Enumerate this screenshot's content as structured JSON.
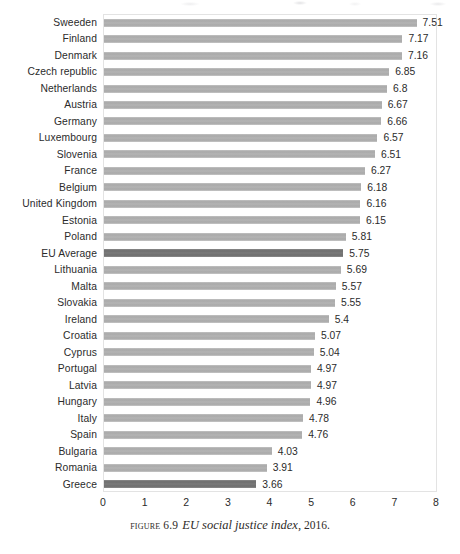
{
  "caption": {
    "figure_word": "Figure",
    "figure_number": "6.9",
    "title": "EU social justice index,",
    "year": "2016."
  },
  "chart_data": {
    "type": "bar",
    "orientation": "horizontal",
    "title": "EU social justice index, 2016",
    "xlabel": "",
    "ylabel": "",
    "xlim": [
      0,
      8
    ],
    "xticks": [
      "0",
      "1",
      "2",
      "3",
      "4",
      "5",
      "6",
      "7",
      "8"
    ],
    "grid": false,
    "legend": "none",
    "bar_color": "#b0b0b0",
    "highlight_color": "#7b7b7b",
    "highlighted": [
      "EU Average",
      "Greece"
    ],
    "categories": [
      "Sweeden",
      "Finland",
      "Denmark",
      "Czech republic",
      "Netherlands",
      "Austria",
      "Germany",
      "Luxembourg",
      "Slovenia",
      "France",
      "Belgium",
      "United Kingdom",
      "Estonia",
      "Poland",
      "EU Average",
      "Lithuania",
      "Malta",
      "Slovakia",
      "Ireland",
      "Croatia",
      "Cyprus",
      "Portugal",
      "Latvia",
      "Hungary",
      "Italy",
      "Spain",
      "Bulgaria",
      "Romania",
      "Greece"
    ],
    "values": [
      7.51,
      7.17,
      7.16,
      6.85,
      6.8,
      6.67,
      6.66,
      6.57,
      6.51,
      6.27,
      6.18,
      6.16,
      6.15,
      5.81,
      5.75,
      5.69,
      5.57,
      5.55,
      5.4,
      5.07,
      5.04,
      4.97,
      4.97,
      4.96,
      4.78,
      4.76,
      4.03,
      3.91,
      3.66
    ],
    "value_labels": [
      "7.51",
      "7.17",
      "7.16",
      "6.85",
      "6.8",
      "6.67",
      "6.66",
      "6.57",
      "6.51",
      "6.27",
      "6.18",
      "6.16",
      "6.15",
      "5.81",
      "5.75",
      "5.69",
      "5.57",
      "5.55",
      "5.4",
      "5.07",
      "5.04",
      "4.97",
      "4.97",
      "4.96",
      "4.78",
      "4.76",
      "4.03",
      "3.91",
      "3.66"
    ]
  }
}
